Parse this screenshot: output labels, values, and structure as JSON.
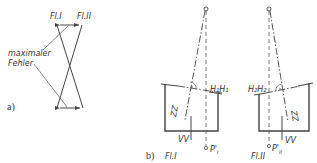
{
  "figure": {
    "part_a": {
      "label": "a)",
      "top_left_label": "Fl.I",
      "top_right_label": "Fl.II",
      "annotation_line1": "maximaler",
      "annotation_line2": "Fehler"
    },
    "part_b": {
      "label": "b)",
      "left": {
        "caption": "Fl.I",
        "axis_label": "ZZ",
        "level_label": "H₁H₁",
        "vertical_label": "VV",
        "point_label": "P'",
        "point_sub": "I"
      },
      "right": {
        "caption": "Fl.II",
        "axis_label": "ZZ",
        "level_label": "H₂H₂",
        "vertical_label": "VV",
        "point_label": "P'",
        "point_sub": "II"
      }
    }
  }
}
